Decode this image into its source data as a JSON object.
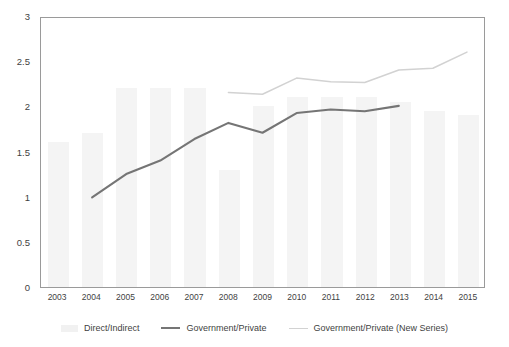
{
  "chart_data": {
    "type": "bar",
    "title": "",
    "subtitle": "",
    "xlabel": "",
    "ylabel": "",
    "ylim": [
      0,
      3
    ],
    "yticks": [
      "0",
      "0.5",
      "1",
      "1.5",
      "2",
      "2.5",
      "3"
    ],
    "ytick_values": [
      0,
      0.5,
      1,
      1.5,
      2,
      2.5,
      3
    ],
    "grid": false,
    "legend_position": "bottom",
    "categories": [
      "2003",
      "2004",
      "2005",
      "2006",
      "2007",
      "2008",
      "2009",
      "2010",
      "2011",
      "2012",
      "2013",
      "2014",
      "2015"
    ],
    "series": [
      {
        "name": "Direct/Indirect",
        "type": "bar",
        "color": "#f4f4f4",
        "values": [
          1.6,
          1.7,
          2.2,
          2.2,
          2.2,
          1.3,
          2.0,
          2.1,
          2.1,
          2.1,
          2.05,
          1.95,
          1.9
        ]
      },
      {
        "name": "Government/Private",
        "type": "line",
        "color": "#757575",
        "values": [
          null,
          1.0,
          1.26,
          1.41,
          1.65,
          1.83,
          1.72,
          1.94,
          1.98,
          1.96,
          2.02,
          null,
          null
        ]
      },
      {
        "name": "Government/Private (New Series)",
        "type": "line",
        "color": "#d2d2d2",
        "values": [
          null,
          null,
          null,
          null,
          null,
          2.17,
          2.15,
          2.33,
          2.29,
          2.28,
          2.42,
          2.44,
          2.62
        ]
      }
    ]
  },
  "legend": {
    "items": [
      {
        "label": "Direct/Indirect",
        "marker": "bar-swatch"
      },
      {
        "label": "Government/Private",
        "marker": "line-dark"
      },
      {
        "label": "Government/Private (New Series)",
        "marker": "line-light"
      }
    ]
  },
  "colors": {
    "bar": "#f4f4f4",
    "line_dark": "#757575",
    "line_light": "#d2d2d2",
    "axis": "#9a9a9a",
    "text": "#3f3f3f",
    "background": "#ffffff"
  }
}
